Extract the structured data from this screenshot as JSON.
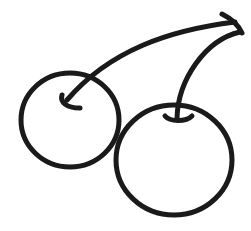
{
  "illustration": {
    "subject": "cherries",
    "style": "hand-drawn line art",
    "stroke_color": "#1a1a1a",
    "background_color": "#ffffff",
    "stroke_width": 5,
    "elements": {
      "left_cherry": {
        "cx": 70,
        "cy": 120,
        "rx": 49,
        "ry": 47
      },
      "right_cherry": {
        "cx": 174,
        "cy": 160,
        "rx": 58,
        "ry": 55
      },
      "left_stem": "M 235 22 C 170 30, 110 50, 67 100",
      "left_stem_hook": "M 62 95 C 60 102, 66 108, 80 108",
      "right_stem": "M 240 32 C 205 40, 178 80, 177 118",
      "right_stem_hook": "M 165 116 C 170 122, 186 122, 192 116",
      "junction_tip": "M 222 14 C 230 18, 238 24, 242 33"
    }
  }
}
